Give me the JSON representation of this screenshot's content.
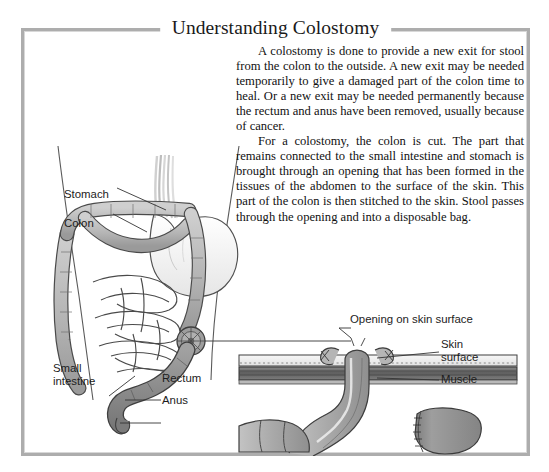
{
  "document": {
    "title": "Understanding Colostomy",
    "frame_color": "#adadad",
    "background": "#ffffff",
    "text_color": "#111111"
  },
  "body_text": {
    "paragraph_1": "A colostomy is done to provide a new exit for stool from the colon to the outside. A new exit may be needed temporarily to give a damaged part of the colon time to heal. Or a new exit may be needed permanently because the rectum and anus have been removed, usually because of cancer.",
    "paragraph_2": "For a colostomy, the colon is cut. The part that remains connected to the small intestine and stomach is brought through an opening that has been formed in the tissues of the abdomen to the surface of the skin. This part of the colon is then stitched to the skin. Stool passes through the opening and into a disposable bag."
  },
  "figure_abdomen": {
    "caption_labels": {
      "stomach": "Stomach",
      "colon": "Colon",
      "small_intestine_line1": "Small",
      "small_intestine_line2": "intestine",
      "rectum": "Rectum",
      "anus": "Anus"
    },
    "colors": {
      "colon": "#b9b9b9",
      "colon_outline": "#4a4a4a",
      "rectum": "#8c8c8c",
      "stomach": "#fbfbfb",
      "small_intestine": "#ffffff",
      "stoma": "#a0a0a0",
      "body_outline": "#555555"
    }
  },
  "figure_cross_section": {
    "caption_labels": {
      "opening": "Opening on skin surface",
      "skin_line1": "Skin",
      "skin_line2": "surface",
      "muscle": "Muscle"
    },
    "colors": {
      "skin": "#efefef",
      "muscle": "#6e6e6e",
      "bowel": "#ababab",
      "bowel_outline": "#3f3f3f",
      "stump": "#8f8f8f"
    }
  }
}
